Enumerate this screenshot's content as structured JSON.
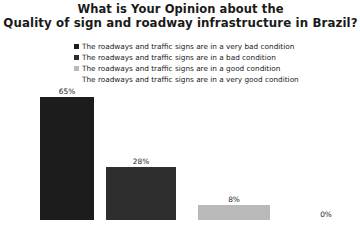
{
  "title": {
    "line1": "What is Your Opinion about the",
    "line2": "Quality of sign and roadway infrastructure in Brazil?"
  },
  "legend": {
    "items": [
      {
        "label": "The roadways and traffic signs are in a very bad condition",
        "color": "#1c1c1c",
        "marker": "square-marker"
      },
      {
        "label": "The roadways and traffic signs are in a  bad condition",
        "color": "#2e2e2e",
        "marker": "square-marker"
      },
      {
        "label": "The roadways and traffic signs are in a good condition",
        "color": "#b9b9b9",
        "marker": "square-marker"
      },
      {
        "label": "The roadways and traffic signs are in a very good condition",
        "color": "#ffffff",
        "marker": "square-marker"
      }
    ]
  },
  "chart_data": {
    "type": "bar",
    "title": "What is Your Opinion about the Quality of sign and roadway infrastructure in Brazil?",
    "xlabel": "",
    "ylabel": "",
    "ylim": [
      0,
      70
    ],
    "grid": false,
    "legend_position": "top",
    "categories": [
      "The roadways and traffic signs are in a very bad condition",
      "The roadways and traffic signs are in a  bad condition",
      "The roadways and traffic signs are in a good condition",
      "The roadways and traffic signs are in a very good condition"
    ],
    "values": [
      65,
      28,
      8,
      0
    ],
    "data_labels": [
      "65%",
      "28%",
      "8%",
      "0%"
    ],
    "colors": [
      "#1c1c1c",
      "#2e2e2e",
      "#b9b9b9",
      "#ffffff"
    ]
  }
}
